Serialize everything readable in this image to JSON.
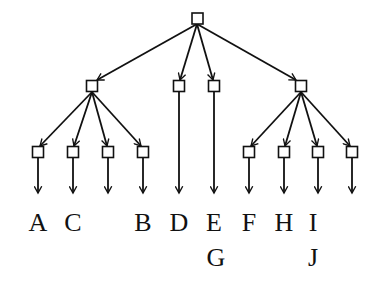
{
  "diagram": {
    "type": "tree",
    "root": {
      "id": "root",
      "x": 197,
      "y": 18
    },
    "mid_nodes": [
      {
        "id": "m1",
        "x": 92,
        "y": 86
      },
      {
        "id": "m2",
        "x": 179,
        "y": 86
      },
      {
        "id": "m3",
        "x": 214,
        "y": 86
      },
      {
        "id": "m4",
        "x": 301,
        "y": 86
      }
    ],
    "leaf_nodes": [
      {
        "id": "l1",
        "x": 38,
        "y": 152,
        "parent": "m1"
      },
      {
        "id": "l2",
        "x": 73,
        "y": 152,
        "parent": "m1"
      },
      {
        "id": "l3",
        "x": 108,
        "y": 152,
        "parent": "m1"
      },
      {
        "id": "l4",
        "x": 143,
        "y": 152,
        "parent": "m1"
      },
      {
        "id": "l5",
        "x": 249,
        "y": 152,
        "parent": "m4"
      },
      {
        "id": "l6",
        "x": 284,
        "y": 152,
        "parent": "m4"
      },
      {
        "id": "l7",
        "x": 318,
        "y": 152,
        "parent": "m4"
      },
      {
        "id": "l8",
        "x": 352,
        "y": 152,
        "parent": "m4"
      }
    ],
    "labels": [
      {
        "text": "A",
        "x": 38,
        "y": 231
      },
      {
        "text": "C",
        "x": 73,
        "y": 231
      },
      {
        "text": "B",
        "x": 143,
        "y": 231
      },
      {
        "text": "D",
        "x": 179,
        "y": 231
      },
      {
        "text": "E",
        "x": 214,
        "y": 231
      },
      {
        "text": "G",
        "x": 214,
        "y": 266
      },
      {
        "text": "F",
        "x": 249,
        "y": 231
      },
      {
        "text": "H",
        "x": 284,
        "y": 231
      },
      {
        "text": "I",
        "x": 318,
        "y": 231
      },
      {
        "text": "J",
        "x": 318,
        "y": 266
      }
    ]
  }
}
